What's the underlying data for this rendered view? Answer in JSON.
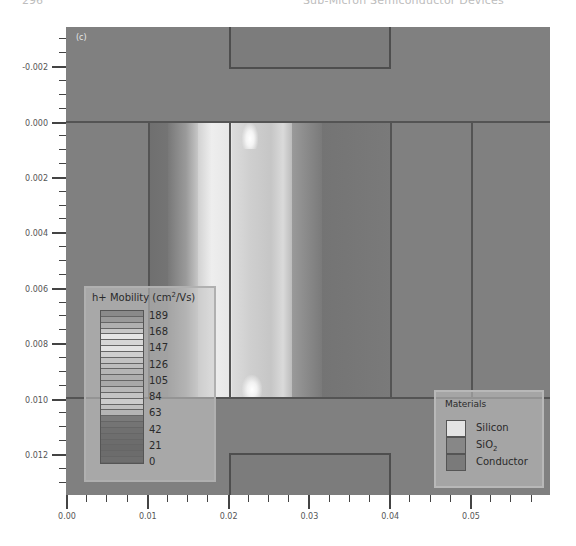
{
  "page_header": {
    "page_number": "296",
    "running_title": "Sub-Micron Semiconductor Devices"
  },
  "figure": {
    "panel_label": "(c)"
  },
  "chart_data": {
    "type": "heatmap",
    "title": "",
    "panel_label": "(c)",
    "xlabel": "",
    "ylabel": "",
    "xlim": [
      0.0,
      0.06
    ],
    "ylim": [
      0.0136,
      -0.0036
    ],
    "x_ticks": [
      "0.00",
      "0.01",
      "0.02",
      "0.03",
      "0.04",
      "0.05"
    ],
    "y_ticks": [
      "-0.002",
      "0.000",
      "0.002",
      "0.004",
      "0.006",
      "0.008",
      "0.010",
      "0.012"
    ],
    "colorbar": {
      "title": "h+ Mobility (cm2/Vs)",
      "ticks": [
        189,
        168,
        147,
        126,
        105,
        84,
        63,
        42,
        21,
        0
      ],
      "range": [
        0,
        189
      ]
    },
    "regions": [
      {
        "material": "SiO2",
        "x": [
          0.0,
          0.06
        ],
        "y": [
          -0.0036,
          0.0
        ]
      },
      {
        "material": "Conductor",
        "label": "top gate",
        "x": [
          0.02,
          0.04
        ],
        "y": [
          -0.0036,
          -0.0019
        ]
      },
      {
        "material": "Silicon",
        "label": "channel",
        "x": [
          0.01,
          0.04
        ],
        "y": [
          0.0,
          0.01
        ]
      },
      {
        "material": "SiO2",
        "x": [
          0.0,
          0.06
        ],
        "y": [
          0.01,
          0.0136
        ]
      },
      {
        "material": "Conductor",
        "label": "bottom gate",
        "x": [
          0.02,
          0.04
        ],
        "y": [
          0.012,
          0.0136
        ]
      }
    ],
    "mobility_profile": {
      "x_positions": [
        0.01,
        0.015,
        0.019,
        0.022,
        0.025,
        0.028,
        0.03,
        0.033,
        0.04
      ],
      "approx_mobility": [
        50,
        70,
        140,
        175,
        150,
        130,
        90,
        60,
        55
      ],
      "peak_hotspots": [
        {
          "x": 0.023,
          "y": 0.0002
        },
        {
          "x": 0.022,
          "y": 0.0098
        }
      ]
    },
    "legend": {
      "title": "Materials",
      "entries": [
        "Silicon",
        "SiO2",
        "Conductor"
      ],
      "position": "bottom-right"
    },
    "grid": false
  },
  "mobility_legend": {
    "title_prefix": "h+ Mobility (cm",
    "title_sup": "2",
    "title_suffix": "/Vs)",
    "values": [
      "189",
      "168",
      "147",
      "126",
      "105",
      "84",
      "63",
      "42",
      "21",
      "0"
    ],
    "stripe_colors": [
      "#8a8a8a",
      "#9a9a9a",
      "#b0b0b0",
      "#c8c8c8",
      "#e6e6e6",
      "#d6d6d6",
      "#e2e2e2",
      "#cfcfcf",
      "#c2c2c2",
      "#bdbdbd",
      "#b5b5b5",
      "#aeaeae",
      "#a8a8a8",
      "#b8b8b8",
      "#c4c4c4",
      "#cccccc",
      "#c0c0c0",
      "#b4b4b4",
      "#7a7a7a",
      "#747474",
      "#707070",
      "#6e6e6e",
      "#6c6c6c",
      "#6a6a6a",
      "#6c6c6c",
      "#6e6e6e"
    ]
  },
  "materials_legend": {
    "title": "Materials",
    "items": [
      {
        "label": "Silicon",
        "sub": "",
        "color": "#e4e4e4"
      },
      {
        "label": "SiO",
        "sub": "2",
        "color": "#878787"
      },
      {
        "label": "Conductor",
        "sub": "",
        "color": "#7a7a7a"
      }
    ]
  },
  "axes": {
    "x_labels": [
      "0.00",
      "0.01",
      "0.02",
      "0.03",
      "0.04",
      "0.05"
    ],
    "y_labels": [
      "-0.002",
      "0.000",
      "0.002",
      "0.004",
      "0.006",
      "0.008",
      "0.010",
      "0.012"
    ]
  },
  "colors": {
    "oxide": "#808080",
    "boundary": "#545454",
    "peak_mobility": "#f2f2f2",
    "low_mobility": "#6f6f6f"
  }
}
